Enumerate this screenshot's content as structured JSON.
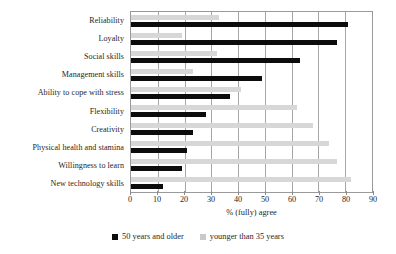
{
  "chart_data": {
    "type": "bar",
    "orientation": "horizontal",
    "title": "",
    "xlabel": "% (fully) agree",
    "ylabel": "",
    "xlim": [
      0,
      90
    ],
    "xticks": [
      0,
      10,
      20,
      30,
      40,
      50,
      60,
      70,
      80,
      90
    ],
    "grid": true,
    "legend_position": "bottom-center",
    "categories": [
      "Reliability",
      "Loyalty",
      "Social skills",
      "Management skills",
      "Ability to cope with stress",
      "Flexibility",
      "Creativity",
      "Physical health and stamina",
      "Willingness to learn",
      "New technology skills"
    ],
    "series": [
      {
        "name": "50 years and older",
        "color": "#0c0c0c",
        "values": [
          81,
          77,
          63,
          49,
          37,
          28,
          23,
          21,
          19,
          12
        ]
      },
      {
        "name": "younger than 35 years",
        "color": "#d7d7d7",
        "values": [
          33,
          19,
          32,
          23,
          41,
          62,
          68,
          74,
          77,
          82
        ]
      }
    ]
  },
  "legend": {
    "items": [
      {
        "label": "50 years and older",
        "swatch": "older"
      },
      {
        "label": "younger than 35 years",
        "swatch": "young"
      }
    ]
  }
}
